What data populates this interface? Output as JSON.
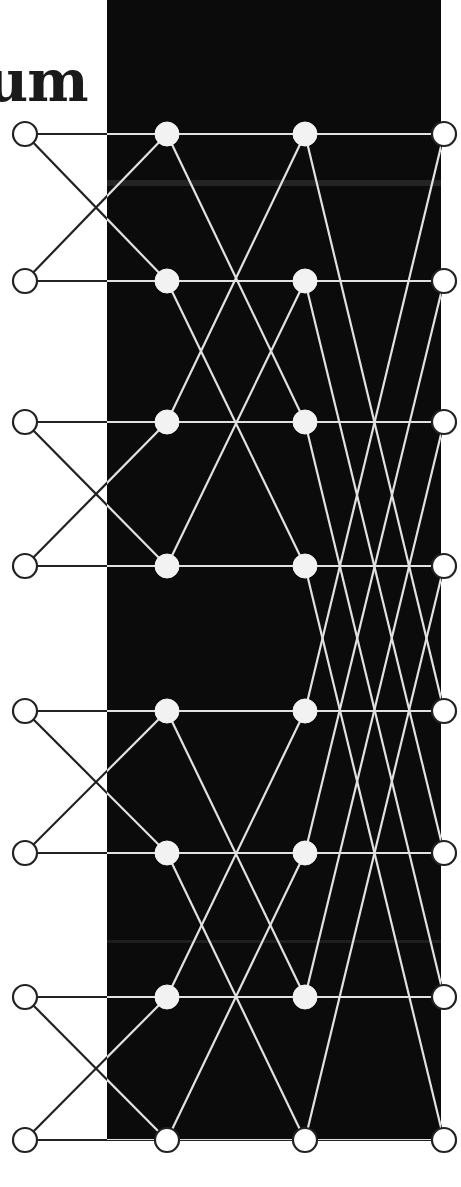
{
  "title_fragment": "um",
  "diagram": {
    "type": "fft-butterfly-signal-flow-graph",
    "points": 8,
    "stages": 3,
    "columns_x": [
      25,
      167,
      305,
      444
    ],
    "rows_y": [
      134,
      281,
      422,
      566,
      711,
      853,
      997,
      1140
    ],
    "node_radius": 12,
    "stage_partner_xor": [
      1,
      2,
      4
    ],
    "panel": {
      "x": 107,
      "y": 0,
      "width": 334,
      "height": 1140
    },
    "colors": {
      "background": "#ffffff",
      "panel": "#0b0b0b",
      "line_on_white": "#222222",
      "line_on_black": "#e2e2e2",
      "node_fill_light": "#f2f2f2",
      "node_fill_white": "#ffffff",
      "node_stroke": "#222222"
    }
  }
}
